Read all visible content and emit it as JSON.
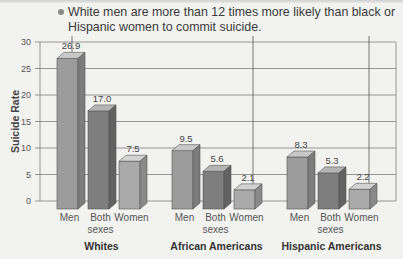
{
  "note": {
    "text": "White men are more than 12 times more likely than black or Hispanic women to commit suicide."
  },
  "chart_data": {
    "type": "bar",
    "title": "",
    "xlabel": "",
    "ylabel": "Suicide Rate",
    "ylim": [
      0,
      30
    ],
    "yticks": [
      0,
      5,
      10,
      15,
      20,
      25,
      30
    ],
    "grid": true,
    "groups": [
      "Whites",
      "African Americans",
      "Hispanic Americans"
    ],
    "categories": [
      "Men",
      "Both sexes",
      "Women"
    ],
    "series": [
      {
        "name": "Whites",
        "values": [
          26.9,
          17.0,
          7.5
        ]
      },
      {
        "name": "African Americans",
        "values": [
          9.5,
          5.6,
          2.1
        ]
      },
      {
        "name": "Hispanic Americans",
        "values": [
          8.3,
          5.3,
          2.2
        ]
      }
    ],
    "value_labels": [
      [
        "26.9",
        "17.0",
        "7.5"
      ],
      [
        "9.5",
        "5.6",
        "2.1"
      ],
      [
        "8.3",
        "5.3",
        "2.2"
      ]
    ],
    "category_labels": [
      [
        "Men"
      ],
      [
        "Both",
        "sexes"
      ],
      [
        "Women"
      ]
    ],
    "colors": {
      "Men": {
        "front": "#9c9c9c",
        "top": "#c8c8c8",
        "side": "#7c7c7c"
      },
      "Both sexes": {
        "front": "#7e7e7e",
        "top": "#b4b4b4",
        "side": "#626262"
      },
      "Women": {
        "front": "#aaaaaa",
        "top": "#d2d2d2",
        "side": "#8a8a8a"
      }
    }
  }
}
